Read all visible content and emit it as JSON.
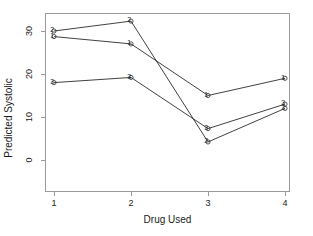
{
  "chart_data": {
    "type": "line",
    "title": "",
    "xlabel": "Drug Used",
    "ylabel": "Predicted Systolic",
    "x": [
      1,
      2,
      3,
      4
    ],
    "xticklabels": [
      "1",
      "2",
      "3",
      "4"
    ],
    "yticklabels": [
      "0",
      "10",
      "20",
      "30"
    ],
    "yticks": [
      0,
      10,
      20,
      30
    ],
    "xlim": [
      0.62,
      4.28
    ],
    "ylim": [
      -2.0,
      35.2
    ],
    "grid": false,
    "legend": false,
    "marker_style": "numeric-label",
    "series": [
      {
        "name": "1",
        "label": "1",
        "values": [
          28.7,
          27.0,
          15.0,
          19.0
        ],
        "color": "#2b2b2b"
      },
      {
        "name": "2",
        "label": "2",
        "values": [
          30.0,
          32.3,
          4.2,
          12.0
        ],
        "color": "#2b2b2b"
      },
      {
        "name": "3",
        "label": "3",
        "values": [
          18.0,
          19.2,
          7.3,
          13.0
        ],
        "color": "#2b2b2b"
      }
    ]
  },
  "axes": {
    "x_title": "Drug Used",
    "y_title": "Predicted Systolic",
    "x_ticks": [
      "1",
      "2",
      "3",
      "4"
    ],
    "y_ticks": [
      "0",
      "10",
      "20",
      "30"
    ]
  },
  "style": {
    "frame_color": "#9a9a9a",
    "line_color": "#2b2b2b",
    "text_color": "#1a1a1a",
    "background": "#ffffff"
  }
}
